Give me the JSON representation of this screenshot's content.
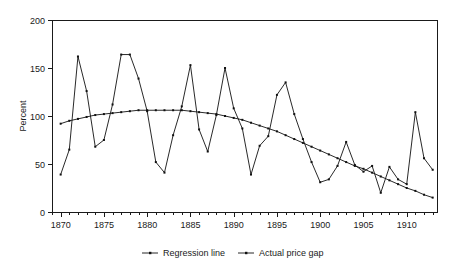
{
  "chart_data": {
    "type": "line",
    "title": "",
    "subtitle": "",
    "xlabel": "",
    "ylabel": "Percent",
    "xlim": [
      1869,
      1913.5
    ],
    "ylim": [
      0,
      200
    ],
    "grid": false,
    "legend_position": "bottom",
    "x_ticks_major": [
      1870,
      1875,
      1880,
      1885,
      1890,
      1895,
      1900,
      1905,
      1910
    ],
    "x_tick_labels": [
      "1870",
      "1875",
      "1880",
      "1885",
      "1890",
      "1895",
      "1900",
      "1905",
      "1910"
    ],
    "x_ticks_minor_step": 1,
    "y_ticks": [
      0,
      50,
      100,
      150,
      200
    ],
    "y_tick_labels": [
      "0",
      "50",
      "100",
      "150",
      "200"
    ],
    "x": [
      1870,
      1871,
      1872,
      1873,
      1874,
      1875,
      1876,
      1877,
      1878,
      1879,
      1880,
      1881,
      1882,
      1883,
      1884,
      1885,
      1886,
      1887,
      1888,
      1889,
      1890,
      1891,
      1892,
      1893,
      1894,
      1895,
      1896,
      1897,
      1898,
      1899,
      1900,
      1901,
      1902,
      1903,
      1904,
      1905,
      1906,
      1907,
      1908,
      1909,
      1910,
      1911,
      1912,
      1913
    ],
    "series": [
      {
        "name": "Actual price gap",
        "marker": "point",
        "color": "#111111",
        "values": [
          39,
          65,
          162,
          126,
          68,
          75,
          112,
          164,
          164,
          139,
          105,
          52,
          41,
          80,
          110,
          153,
          86,
          63,
          101,
          150,
          108,
          87,
          39,
          69,
          79,
          122,
          135,
          102,
          76,
          52,
          31,
          34,
          48,
          73,
          49,
          42,
          48,
          20,
          47,
          34,
          29,
          104,
          56,
          44
        ]
      },
      {
        "name": "Regression line",
        "marker": "point",
        "color": "#111111",
        "values": [
          92,
          95,
          97,
          99,
          101,
          102,
          103,
          104,
          105,
          106,
          106,
          106,
          106,
          106,
          106,
          105,
          104,
          103,
          102,
          100,
          98,
          96,
          93,
          90,
          87,
          84,
          80,
          76,
          72,
          68,
          64,
          60,
          56,
          52,
          48,
          45,
          41,
          37,
          33,
          29,
          25,
          22,
          18,
          15
        ]
      }
    ],
    "series_notes": {
      "actual_price_gap_note": "Highly volatile sawtooth series; peaks at 1872 (162), 1878-79 (164), 1886 (153), 1889 (150), 1896 (135); troughs at 1870 (39), 1883 (41), 1892 (39), 1900 (31)",
      "regression_line_note": "Smooth concave curve rising from 92 at 1870 to a maximum of about 106 around 1880-1884, then declining to about 15 by 1913"
    },
    "legend": [
      {
        "label": "Regression line",
        "marker": "line-with-dot"
      },
      {
        "label": "Actual price gap",
        "marker": "line-with-dot"
      }
    ]
  },
  "axis_colors": {
    "frame": "#1a1a1a",
    "text": "#1a1a1a",
    "series": "#111111"
  }
}
